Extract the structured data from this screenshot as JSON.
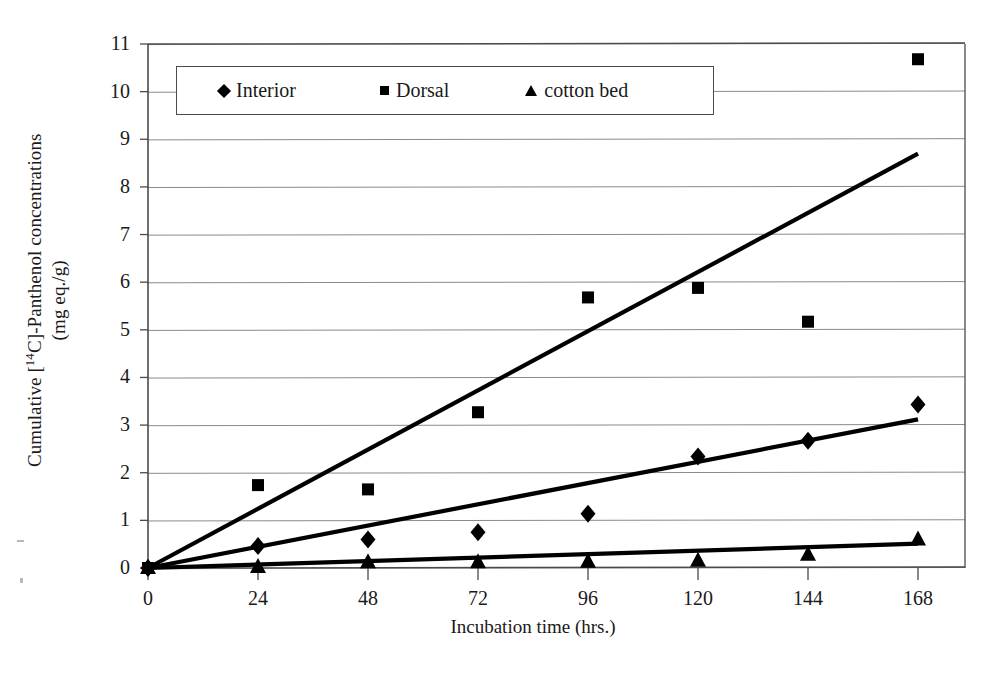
{
  "chart_data": {
    "type": "scatter",
    "title": "",
    "xlabel": "Incubation time (hrs.)",
    "ylabel_line1": "Cumulative [14C]-Panthenol concentrations",
    "ylabel_line2": "(mg eq./g)",
    "ylabel_prefix": "Cumulative [",
    "ylabel_isotope": "14",
    "ylabel_suffix": "C]-Panthenol concentrations",
    "x": [
      0,
      24,
      48,
      72,
      96,
      120,
      144,
      168
    ],
    "xtick_labels": [
      "0",
      "24",
      "48",
      "72",
      "96",
      "120",
      "144",
      "168"
    ],
    "ytick_labels": [
      "0",
      "1",
      "2",
      "3",
      "4",
      "5",
      "6",
      "7",
      "8",
      "9",
      "10",
      "11"
    ],
    "xlim": [
      0,
      168
    ],
    "ylim": [
      0,
      11
    ],
    "grid": "horizontal",
    "legend_position": "top-left-inside",
    "series": [
      {
        "name": "Interior",
        "marker": "diamond",
        "values": [
          0.0,
          0.46,
          0.6,
          0.75,
          1.14,
          2.34,
          2.67,
          3.43
        ],
        "trendline": {
          "x0": 0,
          "y0": 0.0,
          "x1": 168,
          "y1": 3.12
        }
      },
      {
        "name": "Dorsal",
        "marker": "square",
        "values": [
          0.0,
          1.74,
          1.65,
          3.27,
          5.68,
          5.88,
          5.17,
          10.68
        ],
        "trendline": {
          "x0": 0,
          "y0": 0.0,
          "x1": 168,
          "y1": 8.7
        }
      },
      {
        "name": "cotton bed",
        "marker": "triangle",
        "values": [
          0.0,
          0.02,
          0.12,
          0.12,
          0.13,
          0.15,
          0.28,
          0.6
        ],
        "trendline": {
          "x0": 0,
          "y0": 0.0,
          "x1": 168,
          "y1": 0.51
        }
      }
    ]
  },
  "legend": {
    "entries": [
      {
        "label": "Interior",
        "marker": "diamond"
      },
      {
        "label": "Dorsal",
        "marker": "square"
      },
      {
        "label": "cotton bed",
        "marker": "triangle"
      }
    ]
  },
  "colors": {
    "series": "#000000",
    "grid": "#8a8a8a",
    "axis": "#4a4a4a",
    "background": "#ffffff"
  }
}
